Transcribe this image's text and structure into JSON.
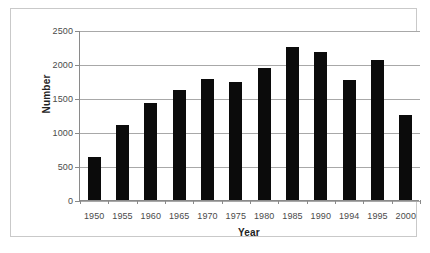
{
  "chart_data": {
    "type": "bar",
    "title": "",
    "xlabel": "Year",
    "ylabel": "Number",
    "categories": [
      "1950",
      "1955",
      "1960",
      "1965",
      "1970",
      "1975",
      "1980",
      "1985",
      "1990",
      "1994",
      "1995",
      "2000"
    ],
    "values": [
      630,
      1105,
      1425,
      1620,
      1780,
      1730,
      1940,
      2255,
      2180,
      1770,
      2060,
      1250
    ],
    "ylim": [
      0,
      2500
    ],
    "yticks": [
      0,
      500,
      1000,
      1500,
      2000,
      2500
    ],
    "ytick_labels": [
      "0",
      "500",
      "1000",
      "1500",
      "2000",
      "2500"
    ],
    "grid": true,
    "legend": false,
    "bar_color": "#0b0b0b",
    "gridline_color": "#a8a8a8",
    "axis_color": "#8a8a8a",
    "border_color": "#c9c9c9",
    "background": "#ffffff"
  }
}
